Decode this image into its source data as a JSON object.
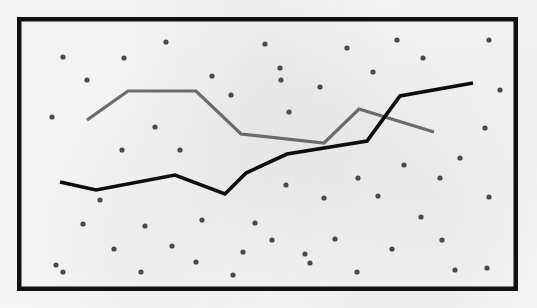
{
  "figure": {
    "background_color": "#fbfbfb",
    "frame": {
      "color": "#111111",
      "x": 17,
      "y": 17,
      "width": 501,
      "height": 274,
      "stroke_width": 4.5
    },
    "plot_area": {
      "x": 21,
      "y": 21,
      "width": 493,
      "height": 266
    }
  },
  "chart_data": {
    "type": "line",
    "title": "",
    "subtitle": "",
    "xlabel": "",
    "ylabel": "",
    "xlim": [
      21,
      514
    ],
    "ylim": [
      21,
      287
    ],
    "grid": false,
    "legend": "none",
    "axis_ticks": "none",
    "tick_labels": [],
    "annotations": [],
    "note": "Pixel-space polyline chart: two unlabeled series drawn over a scattered field of small dots. y values are screen coordinates (smaller y is higher on the page).",
    "series": [
      {
        "name": "gray-series",
        "label": "",
        "color": "#6b6b6b",
        "stroke_width": 3.2,
        "marker": "none",
        "points": [
          [
            87,
            120
          ],
          [
            128,
            91
          ],
          [
            196,
            91
          ],
          [
            241,
            134
          ],
          [
            324,
            143
          ],
          [
            359,
            109
          ],
          [
            434,
            132
          ]
        ],
        "x": [
          87,
          128,
          196,
          241,
          324,
          359,
          434
        ],
        "values": [
          120,
          91,
          91,
          134,
          143,
          109,
          132
        ]
      },
      {
        "name": "black-series",
        "label": "",
        "color": "#0d0d0d",
        "stroke_width": 3.6,
        "marker": "none",
        "points": [
          [
            60,
            182
          ],
          [
            96,
            190
          ],
          [
            175,
            175
          ],
          [
            225,
            194
          ],
          [
            246,
            173
          ],
          [
            287,
            154
          ],
          [
            367,
            141
          ],
          [
            400,
            96
          ],
          [
            473,
            83
          ]
        ],
        "x": [
          60,
          96,
          175,
          225,
          246,
          287,
          367,
          400,
          473
        ],
        "values": [
          182,
          190,
          175,
          194,
          173,
          154,
          141,
          96,
          83
        ]
      }
    ],
    "scatter_field": {
      "name": "background-dots",
      "color": "#4a4a4a",
      "radius": 2.6,
      "count": 53,
      "points": [
        [
          63,
          57
        ],
        [
          124,
          58
        ],
        [
          166,
          42
        ],
        [
          265,
          44
        ],
        [
          347,
          48
        ],
        [
          397,
          40
        ],
        [
          489,
          40
        ],
        [
          87,
          80
        ],
        [
          212,
          76
        ],
        [
          280,
          68
        ],
        [
          320,
          87
        ],
        [
          373,
          72
        ],
        [
          423,
          58
        ],
        [
          52,
          117
        ],
        [
          155,
          127
        ],
        [
          231,
          95
        ],
        [
          281,
          80
        ],
        [
          289,
          112
        ],
        [
          122,
          150
        ],
        [
          180,
          150
        ],
        [
          286,
          185
        ],
        [
          324,
          198
        ],
        [
          83,
          224
        ],
        [
          145,
          226
        ],
        [
          202,
          220
        ],
        [
          255,
          223
        ],
        [
          358,
          178
        ],
        [
          404,
          165
        ],
        [
          440,
          178
        ],
        [
          460,
          158
        ],
        [
          485,
          128
        ],
        [
          114,
          249
        ],
        [
          272,
          240
        ],
        [
          335,
          239
        ],
        [
          378,
          196
        ],
        [
          489,
          197
        ],
        [
          56,
          265
        ],
        [
          141,
          272
        ],
        [
          243,
          252
        ],
        [
          196,
          262
        ],
        [
          310,
          263
        ],
        [
          421,
          217
        ],
        [
          442,
          240
        ],
        [
          392,
          249
        ],
        [
          487,
          268
        ],
        [
          63,
          272
        ],
        [
          233,
          275
        ],
        [
          357,
          272
        ],
        [
          455,
          270
        ],
        [
          305,
          254
        ],
        [
          172,
          246
        ],
        [
          100,
          200
        ],
        [
          500,
          90
        ]
      ]
    }
  }
}
